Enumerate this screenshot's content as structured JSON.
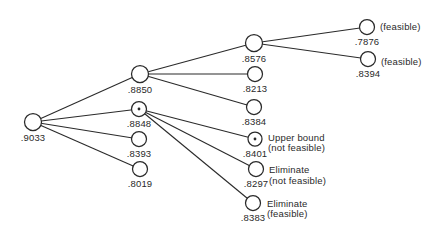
{
  "figure": {
    "background": "#ffffff",
    "ink": "#2a2a2a",
    "width": 434,
    "height": 237
  },
  "diagram": {
    "type": "tree",
    "nodes": [
      {
        "id": "9033",
        "label": ".9033",
        "x": 33,
        "y": 122,
        "r": 8.5,
        "dot": false
      },
      {
        "id": "8850",
        "label": ".8850",
        "x": 140,
        "y": 74,
        "r": 8.5,
        "dot": false
      },
      {
        "id": "8848",
        "label": ".8848",
        "x": 139,
        "y": 109,
        "r": 7.5,
        "dot": true
      },
      {
        "id": "8393",
        "label": ".8393",
        "x": 139,
        "y": 139,
        "r": 7.5,
        "dot": false
      },
      {
        "id": "8019",
        "label": ".8019",
        "x": 140,
        "y": 169,
        "r": 7.5,
        "dot": false
      },
      {
        "id": "8576",
        "label": ".8576",
        "x": 254,
        "y": 43,
        "r": 8.5,
        "dot": false
      },
      {
        "id": "8213",
        "label": ".8213",
        "x": 255,
        "y": 74,
        "r": 7.5,
        "dot": false
      },
      {
        "id": "8384",
        "label": ".8384",
        "x": 254,
        "y": 107,
        "r": 7.5,
        "dot": false
      },
      {
        "id": "8401",
        "label": ".8401",
        "x": 255,
        "y": 139,
        "r": 7,
        "dot": true,
        "annotation": {
          "lines": [
            "Upper bound",
            "(not feasible)"
          ],
          "x": 268,
          "y": 132.5
        }
      },
      {
        "id": "8297",
        "label": ".8297",
        "x": 256,
        "y": 169,
        "r": 7.5,
        "dot": false,
        "annotation": {
          "lines": [
            "Eliminate",
            "(not feasible)"
          ],
          "x": 269,
          "y": 165
        }
      },
      {
        "id": "8383",
        "label": ".8383",
        "x": 253,
        "y": 203,
        "r": 7.5,
        "dot": false,
        "annotation": {
          "lines": [
            "Eliminate",
            "(feasible)"
          ],
          "x": 267,
          "y": 198.5
        }
      },
      {
        "id": "7876",
        "label": ".7876",
        "x": 367,
        "y": 27,
        "r": 7.5,
        "dot": false,
        "annotation": {
          "lines": [
            "(feasible)"
          ],
          "x": 380,
          "y": 21.5
        }
      },
      {
        "id": "8394",
        "label": ".8394",
        "x": 368,
        "y": 59,
        "r": 7.5,
        "dot": false,
        "annotation": {
          "lines": [
            "(feasible)"
          ],
          "x": 381,
          "y": 57
        }
      }
    ],
    "edges": [
      {
        "from": "9033",
        "to": "8850"
      },
      {
        "from": "9033",
        "to": "8848"
      },
      {
        "from": "9033",
        "to": "8393"
      },
      {
        "from": "9033",
        "to": "8019"
      },
      {
        "from": "8850",
        "to": "8576"
      },
      {
        "from": "8850",
        "to": "8213"
      },
      {
        "from": "8850",
        "to": "8384"
      },
      {
        "from": "8848",
        "to": "8401"
      },
      {
        "from": "8848",
        "to": "8297"
      },
      {
        "from": "8848",
        "to": "8383"
      },
      {
        "from": "8576",
        "to": "7876"
      },
      {
        "from": "8576",
        "to": "8394"
      }
    ]
  }
}
